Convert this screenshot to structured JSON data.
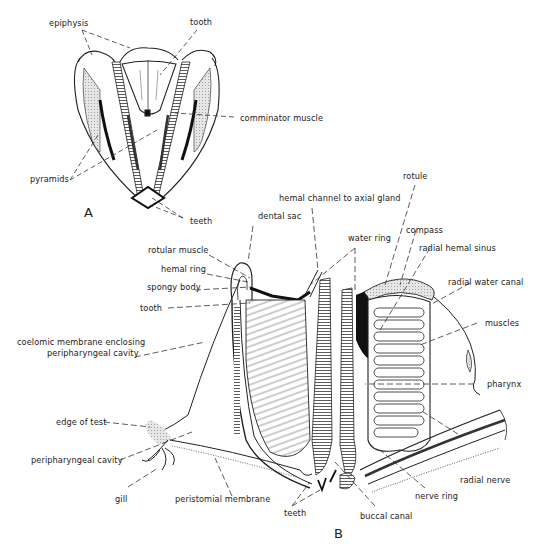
{
  "figure": {
    "panel_a_letter": "A",
    "panel_b_letter": "B",
    "panel_a_labels": {
      "epiphysis": "epiphysis",
      "tooth": "tooth",
      "comminator_muscle": "comminator muscle",
      "pyramids": "pyramids",
      "teeth": "teeth"
    },
    "panel_b_labels": {
      "rotule": "rotule",
      "hemal_channel": "hemal channel to axial gland",
      "dental_sac": "dental sac",
      "compass": "compass",
      "water_ring": "water ring",
      "radial_hemal_sinus": "radial  hemal sinus",
      "rotular_muscle": "rotular muscle",
      "hemal_ring": "hemal ring",
      "spongy_body": "spongy body",
      "radial_water_canal": "radial water canal",
      "tooth": "tooth",
      "muscles": "muscles",
      "coelomic_line1": "coelomic membrane enclosing",
      "coelomic_line2": "peripharyngeal cavity",
      "pharynx": "pharynx",
      "edge_of_test": "edge of test",
      "peripharyngeal_cavity": "peripharyngeal cavity",
      "radial_nerve": "radial nerve",
      "gill": "gill",
      "peristomial_membrane": "peristomial membrane",
      "nerve_ring": "nerve ring",
      "teeth": "teeth",
      "buccal_canal": "buccal canal"
    }
  }
}
